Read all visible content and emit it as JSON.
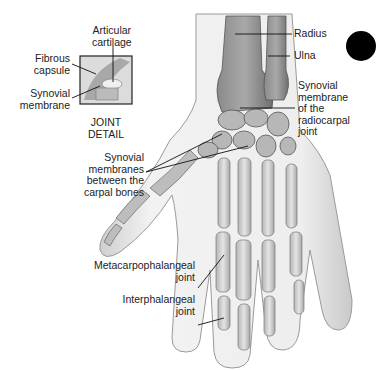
{
  "diagram": {
    "labels": {
      "articular_cartilage": "Articular\ncartilage",
      "fibrous_capsule": "Fibrous\ncapsule",
      "synovial_membrane": "Synovial\nmembrane",
      "joint_detail": "JOINT\nDETAIL",
      "radius": "Radius",
      "ulna": "Ulna",
      "synovial_radiocarpal": "Synovial\nmembrane\nof the\nradiocarpal\njoint",
      "synovial_carpal": "Synovial\nmembranes\nbetween the\ncarpal bones",
      "metacarpophalangeal": "Metacarpophalangeal\njoint",
      "interphalangeal": "Interphalangeal\njoint"
    },
    "colors": {
      "background": "#ffffff",
      "text": "#222222",
      "leader_line": "#111111",
      "bone_dark": "#7a7a7a",
      "bone_mid": "#a8a8a8",
      "skin": "#e6e6e6",
      "marker_dot": "#000000"
    }
  }
}
